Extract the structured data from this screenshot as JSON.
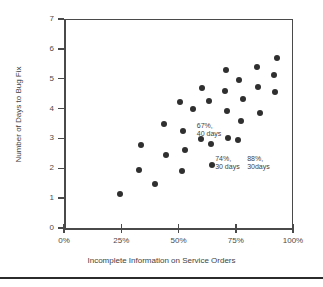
{
  "chart_data": {
    "type": "scatter",
    "title": "",
    "xlabel": "Incomplete Information on Service Orders",
    "ylabel": "Number of Days to Bug Fix",
    "xlim": [
      0,
      100
    ],
    "ylim": [
      0,
      7
    ],
    "xticks": [
      0,
      25,
      50,
      75,
      100
    ],
    "xtick_labels": [
      "0%",
      "25%",
      "50%",
      "75%",
      "100%"
    ],
    "yticks": [
      0,
      1,
      2,
      3,
      4,
      5,
      6,
      7
    ],
    "ytick_labels": [
      "0",
      "1",
      "2",
      "3",
      "4",
      "5",
      "6",
      "7"
    ],
    "grid": false,
    "legend": "none",
    "marker": "filled-circle",
    "marker_color": "#2f2f2f",
    "points": [
      {
        "x": 24.5,
        "y": 1.15
      },
      {
        "x": 32.8,
        "y": 1.95
      },
      {
        "x": 33.6,
        "y": 2.78
      },
      {
        "x": 39.7,
        "y": 1.48
      },
      {
        "x": 43.7,
        "y": 3.47
      },
      {
        "x": 44.5,
        "y": 2.43
      },
      {
        "x": 50.7,
        "y": 4.22
      },
      {
        "x": 51.5,
        "y": 1.9
      },
      {
        "x": 52.0,
        "y": 3.25
      },
      {
        "x": 52.8,
        "y": 2.6
      },
      {
        "x": 56.3,
        "y": 3.98
      },
      {
        "x": 59.8,
        "y": 2.98
      },
      {
        "x": 60.3,
        "y": 4.7
      },
      {
        "x": 63.3,
        "y": 4.25
      },
      {
        "x": 64.2,
        "y": 2.8
      },
      {
        "x": 64.6,
        "y": 2.1
      },
      {
        "x": 70.3,
        "y": 4.6
      },
      {
        "x": 70.7,
        "y": 5.3
      },
      {
        "x": 71.2,
        "y": 3.93
      },
      {
        "x": 71.6,
        "y": 3.02
      },
      {
        "x": 76.0,
        "y": 2.95
      },
      {
        "x": 76.4,
        "y": 4.97
      },
      {
        "x": 77.3,
        "y": 3.6
      },
      {
        "x": 78.2,
        "y": 4.32
      },
      {
        "x": 84.3,
        "y": 5.4
      },
      {
        "x": 84.7,
        "y": 4.73
      },
      {
        "x": 85.6,
        "y": 3.85
      },
      {
        "x": 91.7,
        "y": 5.12
      },
      {
        "x": 92.1,
        "y": 4.57
      },
      {
        "x": 93.0,
        "y": 5.7
      }
    ],
    "annotations": [
      {
        "text": "67%,\n40 days",
        "x": 58.0,
        "y": 3.55
      },
      {
        "text": "74%,\n30 days",
        "x": 66.0,
        "y": 2.45
      },
      {
        "text": "88%,\n30days",
        "x": 80.0,
        "y": 2.45
      }
    ]
  }
}
